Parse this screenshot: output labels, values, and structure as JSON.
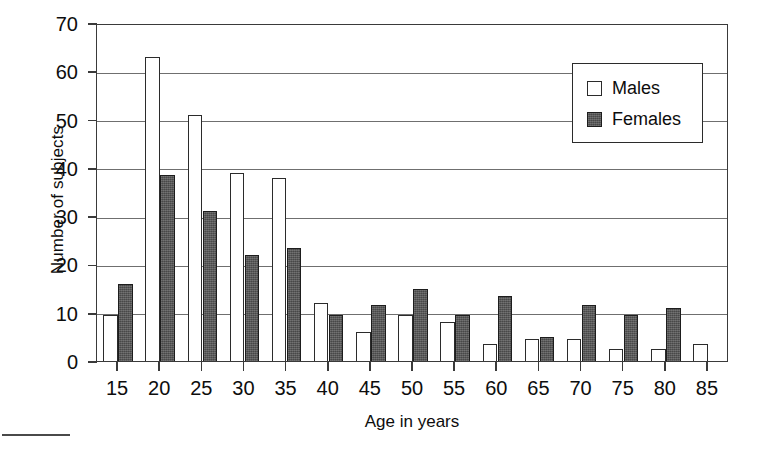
{
  "chart_data": {
    "type": "bar",
    "title": "",
    "xlabel": "Age in years",
    "ylabel": "Number of subjects",
    "categories": [
      "15",
      "20",
      "25",
      "30",
      "35",
      "40",
      "45",
      "50",
      "55",
      "60",
      "65",
      "70",
      "75",
      "80",
      "85"
    ],
    "series": [
      {
        "name": "Males",
        "color": "#ffffff",
        "edge_color": "#2b2b2b",
        "values": [
          9.5,
          63,
          51,
          39,
          38,
          12,
          6,
          9.5,
          8,
          3.5,
          4.5,
          4.5,
          2.5,
          2.5,
          3.5
        ]
      },
      {
        "name": "Females",
        "color": "#565656",
        "edge_color": "#1d1d1d",
        "values": [
          16,
          38.5,
          31,
          22,
          23.5,
          9.5,
          11.5,
          15,
          9.5,
          13.5,
          5,
          11.5,
          9.5,
          11,
          0
        ]
      }
    ],
    "ylim": [
      0,
      70
    ],
    "yticks": [
      0,
      10,
      20,
      30,
      40,
      50,
      60,
      70
    ],
    "ytick_labels": [
      "0",
      "10",
      "20",
      "30",
      "40",
      "50",
      "60",
      "70"
    ],
    "grid": true,
    "grid_axis": "y",
    "legend_position": "top-right",
    "frame": true
  },
  "legend": {
    "entries": [
      {
        "label": "Males",
        "swatch": "open-square-swatch"
      },
      {
        "label": "Females",
        "swatch": "filled-square-swatch"
      }
    ]
  }
}
